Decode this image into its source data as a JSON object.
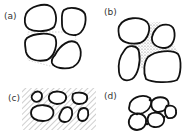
{
  "panels": [
    {
      "id": "a",
      "label": "(a)",
      "description": "Grains with sparse thin bridging fines"
    },
    {
      "id": "b",
      "label": "(b)",
      "description": "Grains with fine-grained matrix filling pores"
    },
    {
      "id": "c",
      "label": "(c)",
      "description": "Grains floating in hatched matrix"
    },
    {
      "id": "d",
      "label": "(d)",
      "description": "Grains in contact with cement at contacts"
    }
  ]
}
